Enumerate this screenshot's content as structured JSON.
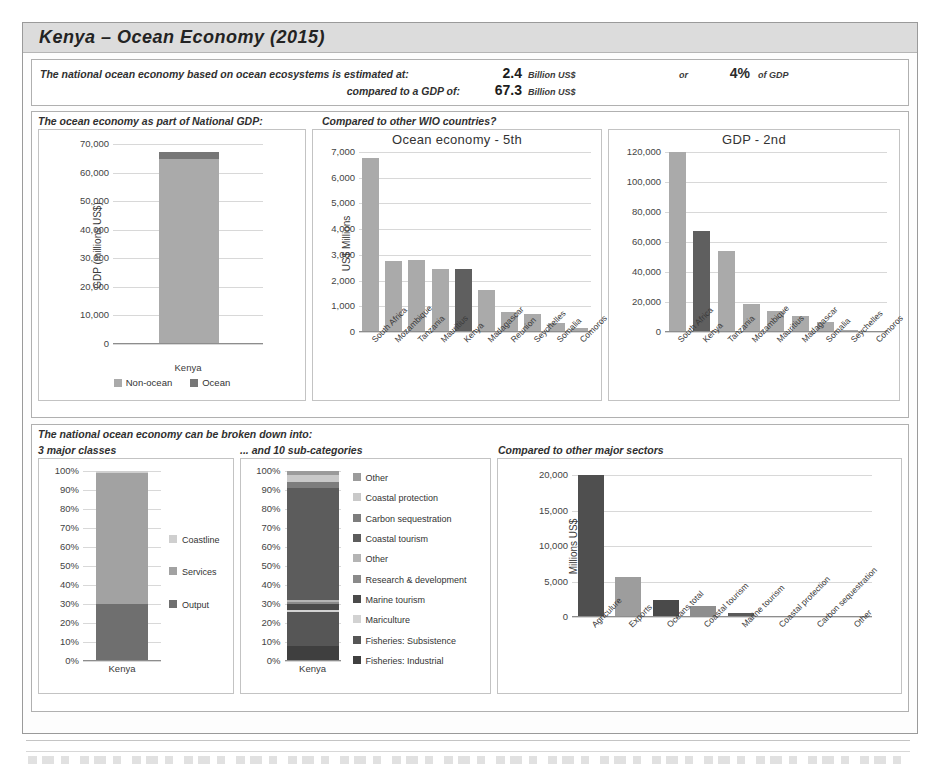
{
  "title": "Kenya  –  Ocean Economy (2015)",
  "summary": {
    "line1_label": "The national ocean economy based on ocean ecosystems is estimated at:",
    "line1_value": "2.4",
    "line1_unit": "Billion US$",
    "or_label": "or",
    "pct_value": "4%",
    "pct_unit": "of GDP",
    "line2_label": "compared to a GDP of:",
    "line2_value": "67.3",
    "line2_unit": "Billion US$"
  },
  "section_top": {
    "head_left": "The ocean economy as part of National GDP:",
    "head_right": "Compared to other WIO countries?"
  },
  "section_bottom": {
    "head": "The national ocean economy can be broken down into:",
    "head_a": "3 major classes",
    "head_b": "... and 10 sub-categories",
    "head_c": "Compared to other major sectors"
  },
  "colors": {
    "bar": "#aaaaaa",
    "bar_highlight": "#5f5f5f",
    "dark": "#4c4c4c",
    "mid": "#8f8f8f",
    "light": "#c6c6c6",
    "band": "#dcdcdc"
  },
  "chart_data": [
    {
      "id": "gdp_stacked",
      "type": "bar",
      "stacked": true,
      "title": "",
      "ylabel": "GDP (millions US$)",
      "xlabel": "",
      "categories": [
        "Kenya"
      ],
      "ylim": [
        0,
        70000
      ],
      "yticks": [
        0,
        10000,
        20000,
        30000,
        40000,
        50000,
        60000,
        70000
      ],
      "ytick_labels": [
        "0",
        "10,000",
        "20,000",
        "30,000",
        "40,000",
        "50,000",
        "60,000",
        "70,000"
      ],
      "grid": true,
      "legend_position": "bottom",
      "series": [
        {
          "name": "Non-ocean",
          "values": [
            64900
          ],
          "color": "#aaaaaa"
        },
        {
          "name": "Ocean",
          "values": [
            2400
          ],
          "color": "#777777"
        }
      ]
    },
    {
      "id": "ocean_economy_wio",
      "type": "bar",
      "title": "Ocean economy - 5th",
      "ylabel": "US$ Millions",
      "xlabel": "",
      "ylim": [
        0,
        7000
      ],
      "yticks": [
        0,
        1000,
        2000,
        3000,
        4000,
        5000,
        6000,
        7000
      ],
      "ytick_labels": [
        "0",
        "1,000",
        "2,000",
        "3,000",
        "4,000",
        "5,000",
        "6,000",
        "7,000"
      ],
      "grid": true,
      "highlight": "Kenya",
      "categories": [
        "South Africa",
        "Mozambique",
        "Tanzania",
        "Mauritius",
        "Kenya",
        "Madagascar",
        "Reunion",
        "Seychelles",
        "Somalia",
        "Comoros"
      ],
      "values": [
        6750,
        2780,
        2790,
        2450,
        2470,
        1650,
        790,
        720,
        370,
        140
      ]
    },
    {
      "id": "gdp_wio",
      "type": "bar",
      "title": "GDP - 2nd",
      "ylabel": "",
      "xlabel": "",
      "ylim": [
        0,
        120000
      ],
      "yticks": [
        0,
        20000,
        40000,
        60000,
        80000,
        100000,
        120000
      ],
      "ytick_labels": [
        "0",
        "20,000",
        "40,000",
        "60,000",
        "80,000",
        "100,000",
        "120,000"
      ],
      "grid": true,
      "highlight": "Kenya",
      "categories": [
        "South Africa",
        "Kenya",
        "Tanzania",
        "Mozambique",
        "Mauritius",
        "Madagascar",
        "Somalia",
        "Seychelles",
        "Comoros"
      ],
      "values": [
        120000,
        67300,
        54000,
        19000,
        14000,
        11000,
        6500,
        1400,
        600
      ]
    },
    {
      "id": "three_major_classes",
      "type": "bar",
      "stacked": true,
      "title": "3 major classes",
      "ylabel": "",
      "categories": [
        "Kenya"
      ],
      "ylim": [
        0,
        100
      ],
      "yticks": [
        0,
        10,
        20,
        30,
        40,
        50,
        60,
        70,
        80,
        90,
        100
      ],
      "ytick_labels": [
        "0%",
        "10%",
        "20%",
        "30%",
        "40%",
        "50%",
        "60%",
        "70%",
        "80%",
        "90%",
        "100%"
      ],
      "grid": true,
      "legend_position": "right",
      "series": [
        {
          "name": "Output",
          "values": [
            30
          ],
          "color": "#6f6f6f"
        },
        {
          "name": "Services",
          "values": [
            69
          ],
          "color": "#a2a2a2"
        },
        {
          "name": "Coastline",
          "values": [
            1
          ],
          "color": "#cfcfcf"
        }
      ]
    },
    {
      "id": "ten_sub_categories",
      "type": "bar",
      "stacked": true,
      "title": "... and 10 sub-categories",
      "ylabel": "",
      "categories": [
        "Kenya"
      ],
      "ylim": [
        0,
        100
      ],
      "yticks": [
        0,
        10,
        20,
        30,
        40,
        50,
        60,
        70,
        80,
        90,
        100
      ],
      "ytick_labels": [
        "0%",
        "10%",
        "20%",
        "30%",
        "40%",
        "50%",
        "60%",
        "70%",
        "80%",
        "90%",
        "100%"
      ],
      "grid": true,
      "legend_position": "right",
      "series": [
        {
          "name": "Fisheries: Industrial",
          "values": [
            8
          ],
          "color": "#3f3f3f"
        },
        {
          "name": "Fisheries: Subsistence",
          "values": [
            18
          ],
          "color": "#565656"
        },
        {
          "name": "Mariculture",
          "values": [
            1
          ],
          "color": "#d2d2d2"
        },
        {
          "name": "Marine tourism",
          "values": [
            3
          ],
          "color": "#4a4a4a"
        },
        {
          "name": "Research & development",
          "values": [
            1
          ],
          "color": "#8a8a8a"
        },
        {
          "name": "Other",
          "values": [
            1
          ],
          "color": "#b4b4b4"
        },
        {
          "name": "Coastal tourism",
          "values": [
            59
          ],
          "color": "#5c5c5c"
        },
        {
          "name": "Carbon sequestration",
          "values": [
            3
          ],
          "color": "#7d7d7d"
        },
        {
          "name": "Coastal protection",
          "values": [
            4
          ],
          "color": "#c9c9c9"
        },
        {
          "name": "Other",
          "values": [
            2
          ],
          "color": "#9b9b9b"
        }
      ],
      "legend_order": [
        "Other",
        "Coastal protection",
        "Carbon sequestration",
        "Coastal tourism",
        "Other",
        "Research & development",
        "Marine tourism",
        "Mariculture",
        "Fisheries: Subsistence",
        "Fisheries: Industrial"
      ]
    },
    {
      "id": "major_sectors",
      "type": "bar",
      "title": "Compared to other major sectors",
      "ylabel": "Millions US$",
      "ylim": [
        0,
        20000
      ],
      "yticks": [
        0,
        5000,
        10000,
        15000,
        20000
      ],
      "ytick_labels": [
        "0",
        "5,000",
        "10,000",
        "15,000",
        "20,000"
      ],
      "grid": true,
      "categories": [
        "Agriculure",
        "Exports",
        "Oceans total",
        "Coastal tourism",
        "Marine tourism",
        "Coastal protection",
        "Carbon sequestration",
        "Other"
      ],
      "values": [
        21000,
        5700,
        2400,
        1500,
        600,
        150,
        80,
        50
      ],
      "bar_colors": [
        "#4f4f4f",
        "#9d9d9d",
        "#4a4a4a",
        "#8e8e8e",
        "#5a5a5a",
        "#a6a6a6",
        "#707070",
        "#9a9a9a"
      ]
    }
  ]
}
